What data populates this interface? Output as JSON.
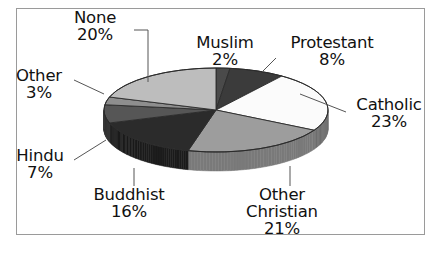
{
  "frame": {
    "border_color": "#9a9a9a",
    "background": "#ffffff"
  },
  "chart_data": {
    "type": "pie",
    "title": "",
    "subtitle": "",
    "xlabel": "",
    "ylabel": "",
    "legend_position": "none",
    "grid": false,
    "three_d": true,
    "labels_show_percent": true,
    "total": 100,
    "categories": [
      "Muslim",
      "Protestant",
      "Catholic",
      "Other Christian",
      "Buddhist",
      "Hindu",
      "Other",
      "None"
    ],
    "values": [
      2,
      8,
      23,
      21,
      16,
      7,
      3,
      20
    ],
    "slices": [
      {
        "name": "Muslim",
        "value": 2,
        "percent_label": "2%",
        "color": "#4a4a4a",
        "side_color": "#303030"
      },
      {
        "name": "Protestant",
        "value": 8,
        "percent_label": "8%",
        "color": "#3b3b3b",
        "side_color": "#252525"
      },
      {
        "name": "Catholic",
        "value": 23,
        "percent_label": "23%",
        "color": "#fbfbfb",
        "side_color": "#6f6f6f"
      },
      {
        "name": "Other Christian",
        "value": 21,
        "percent_label": "21%",
        "color": "#9d9d9d",
        "side_color": "#7a7a7a"
      },
      {
        "name": "Buddhist",
        "value": 16,
        "percent_label": "16%",
        "color": "#2b2b2b",
        "side_color": "#1c1c1c"
      },
      {
        "name": "Hindu",
        "value": 7,
        "percent_label": "7%",
        "color": "#565656",
        "side_color": "#383838"
      },
      {
        "name": "Other",
        "value": 3,
        "percent_label": "3%",
        "color": "#8e8e8e",
        "side_color": "#5e5e5e"
      },
      {
        "name": "None",
        "value": 20,
        "percent_label": "20%",
        "color": "#bdbdbd",
        "side_color": "#8f8f8f"
      }
    ]
  },
  "labels": {
    "none": {
      "name": "None",
      "percent": "20%"
    },
    "other": {
      "name": "Other",
      "percent": "3%"
    },
    "hindu": {
      "name": "Hindu",
      "percent": "7%"
    },
    "buddhist": {
      "name": "Buddhist",
      "percent": "16%"
    },
    "muslim": {
      "name": "Muslim",
      "percent": "2%"
    },
    "protestant": {
      "name": "Protestant",
      "percent": "8%"
    },
    "catholic": {
      "name": "Catholic",
      "percent": "23%"
    },
    "other_christian": {
      "name_line1": "Other",
      "name_line2": "Christian",
      "percent": "21%"
    }
  }
}
